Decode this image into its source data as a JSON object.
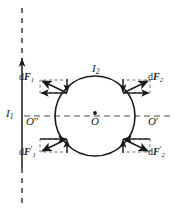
{
  "figure": {
    "name": "magnetic-force-on-circular-loop-diagram",
    "type": "physics-schematic",
    "background": "#ffffff",
    "ink_color": "#1a1a1a",
    "width": 175,
    "height": 211
  },
  "labels": {
    "wire_current": "I",
    "wire_current_sub": "1",
    "loop_current": "I",
    "loop_current_sub": "2",
    "center_point": "O",
    "right_point": "O",
    "right_point_prime": "′",
    "left_point": "O",
    "left_point_prime": "″",
    "force_upper_left": "d",
    "force_upper_left_sym": "F",
    "force_upper_left_sub": "1",
    "force_upper_right": "d",
    "force_upper_right_sym": "F",
    "force_upper_right_sub": "2",
    "force_lower_left": "d",
    "force_lower_left_sym": "F",
    "force_lower_left_sub": "1",
    "force_lower_left_prime": "′",
    "force_lower_right": "d",
    "force_lower_right_sym": "F",
    "force_lower_right_sub": "2",
    "force_lower_right_prime": "′"
  },
  "geometry": {
    "wire_x": 22,
    "wire_top_dash_start": 8,
    "wire_solid_start": 60,
    "wire_solid_end": 168,
    "wire_bottom_dash_end": 203,
    "circle_cx": 95,
    "circle_cy": 116,
    "circle_r": 40,
    "axis_y": 116,
    "axis_x_start": 24,
    "axis_x_end": 172
  },
  "colors": {
    "ink": "#1a1a1a",
    "dash": "#555555",
    "page": "#ffffff"
  }
}
